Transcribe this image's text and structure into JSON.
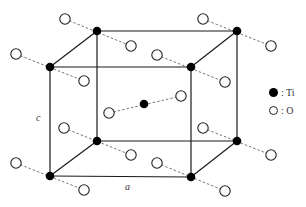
{
  "diagram": {
    "axis_labels": {
      "a": "a",
      "c": "c"
    },
    "legend": [
      {
        "symbol": "filled-circle",
        "label": ": Ti",
        "color": "#000000"
      },
      {
        "symbol": "open-circle",
        "label": ": O",
        "color": "#ffffff"
      }
    ],
    "cube": {
      "front": {
        "x1": 50,
        "y1": 67,
        "x2": 191,
        "y2": 176
      },
      "back": {
        "x1": 97,
        "y1": 31,
        "x2": 237,
        "y2": 141
      }
    },
    "ti_atoms": [
      {
        "id": "back-top-left",
        "x": 97,
        "y": 31
      },
      {
        "id": "back-top-right",
        "x": 237,
        "y": 31
      },
      {
        "id": "front-top-left",
        "x": 50,
        "y": 67
      },
      {
        "id": "front-top-right",
        "x": 191,
        "y": 67
      },
      {
        "id": "back-bottom-left",
        "x": 97,
        "y": 141
      },
      {
        "id": "back-bottom-right",
        "x": 237,
        "y": 141
      },
      {
        "id": "front-bottom-left",
        "x": 50,
        "y": 176
      },
      {
        "id": "front-bottom-right",
        "x": 191,
        "y": 177
      },
      {
        "id": "body-center",
        "x": 144,
        "y": 104
      }
    ],
    "o_bonds": [
      {
        "ti": "back-top-left",
        "o1": [
          65,
          19
        ],
        "o2": [
          131,
          46
        ]
      },
      {
        "ti": "back-top-right",
        "o1": [
          203,
          19
        ],
        "o2": [
          271,
          46
        ]
      },
      {
        "ti": "front-top-left",
        "o1": [
          16,
          54
        ],
        "o2": [
          84,
          81
        ]
      },
      {
        "ti": "front-top-right",
        "o1": [
          157,
          55
        ],
        "o2": [
          225,
          82
        ]
      },
      {
        "ti": "back-bottom-left",
        "o1": [
          64,
          128
        ],
        "o2": [
          131,
          155
        ]
      },
      {
        "ti": "back-bottom-right",
        "o1": [
          203,
          128
        ],
        "o2": [
          271,
          155
        ]
      },
      {
        "ti": "front-bottom-left",
        "o1": [
          16,
          163
        ],
        "o2": [
          84,
          190
        ]
      },
      {
        "ti": "front-bottom-right",
        "o1": [
          157,
          163
        ],
        "o2": [
          225,
          191
        ]
      },
      {
        "ti": "body-center",
        "o1": [
          109,
          113
        ],
        "o2": [
          181,
          96
        ]
      }
    ]
  }
}
